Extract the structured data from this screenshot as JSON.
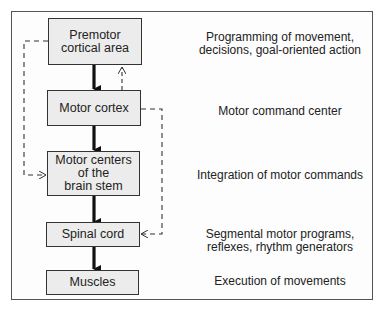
{
  "diagram": {
    "levels": [
      {
        "label": "Premotor\ncortical area",
        "description": "Programming of movement,\ndecisions, goal-oriented action"
      },
      {
        "label": "Motor cortex",
        "description": "Motor command center"
      },
      {
        "label": "Motor centers\nof the\nbrain stem",
        "description": "Integration of motor commands"
      },
      {
        "label": "Spinal cord",
        "description": "Segmental motor programs,\nreflexes, rhythm generators"
      },
      {
        "label": "Muscles",
        "description": "Execution of movements"
      }
    ],
    "connections": [
      {
        "from": "Premotor cortical area",
        "to": "Motor cortex",
        "style": "solid"
      },
      {
        "from": "Motor cortex",
        "to": "Motor centers of the brain stem",
        "style": "solid"
      },
      {
        "from": "Motor centers of the brain stem",
        "to": "Spinal cord",
        "style": "solid"
      },
      {
        "from": "Spinal cord",
        "to": "Muscles",
        "style": "solid"
      },
      {
        "from": "Motor cortex",
        "to": "Premotor cortical area",
        "style": "dashed"
      },
      {
        "from": "Premotor cortical area",
        "to": "Motor centers of the brain stem",
        "style": "dashed"
      },
      {
        "from": "Motor cortex",
        "to": "Spinal cord",
        "style": "dashed"
      }
    ]
  }
}
